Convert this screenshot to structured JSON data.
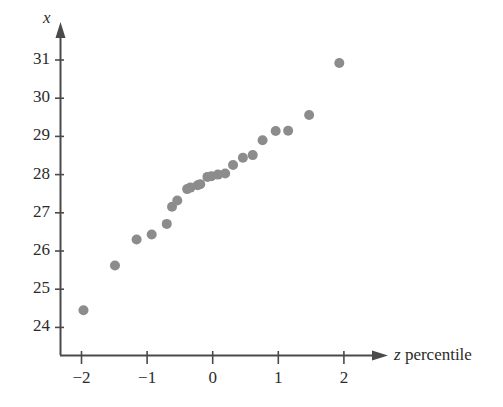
{
  "figure": {
    "background": "#ffffff",
    "axis_color": "#4a4a4a",
    "point_color": "#8c8c8c",
    "point_radius": 5
  },
  "axes": {
    "y_axis_title": "x",
    "x_axis_title_symbol": "z",
    "x_axis_title_text": " percentile",
    "y_ticks": [
      "24",
      "25",
      "26",
      "27",
      "28",
      "29",
      "30",
      "31"
    ],
    "x_ticks": [
      "−2",
      "−1",
      "0",
      "1",
      "2"
    ]
  },
  "chart_data": {
    "type": "scatter",
    "title": "",
    "xlabel": "z percentile",
    "ylabel": "x",
    "xlim": [
      -2.5,
      2.6
    ],
    "ylim": [
      23.4,
      31.6
    ],
    "grid": false,
    "legend": null,
    "x": [
      -1.97,
      -1.49,
      -1.16,
      -0.93,
      -0.7,
      -0.62,
      -0.54,
      -0.39,
      -0.34,
      -0.23,
      -0.19,
      -0.08,
      -0.02,
      0.08,
      0.19,
      0.31,
      0.46,
      0.61,
      0.76,
      0.96,
      1.15,
      1.47,
      1.93
    ],
    "y": [
      24.45,
      25.62,
      26.3,
      26.43,
      26.71,
      27.16,
      27.32,
      27.62,
      27.66,
      27.72,
      27.75,
      27.94,
      27.96,
      28.0,
      28.03,
      28.25,
      28.44,
      28.51,
      28.9,
      29.14,
      29.15,
      29.56,
      30.92
    ],
    "points": [
      {
        "z": -1.97,
        "x": 24.45
      },
      {
        "z": -1.49,
        "x": 25.62
      },
      {
        "z": -1.16,
        "x": 26.3
      },
      {
        "z": -0.93,
        "x": 26.43
      },
      {
        "z": -0.7,
        "x": 26.71
      },
      {
        "z": -0.62,
        "x": 27.16
      },
      {
        "z": -0.54,
        "x": 27.32
      },
      {
        "z": -0.39,
        "x": 27.62
      },
      {
        "z": -0.34,
        "x": 27.66
      },
      {
        "z": -0.23,
        "x": 27.72
      },
      {
        "z": -0.19,
        "x": 27.75
      },
      {
        "z": -0.08,
        "x": 27.94
      },
      {
        "z": -0.02,
        "x": 27.96
      },
      {
        "z": 0.08,
        "x": 28.0
      },
      {
        "z": 0.19,
        "x": 28.03
      },
      {
        "z": 0.31,
        "x": 28.25
      },
      {
        "z": 0.46,
        "x": 28.44
      },
      {
        "z": 0.61,
        "x": 28.51
      },
      {
        "z": 0.76,
        "x": 28.9
      },
      {
        "z": 0.96,
        "x": 29.14
      },
      {
        "z": 1.15,
        "x": 29.15
      },
      {
        "z": 1.47,
        "x": 29.56
      },
      {
        "z": 1.93,
        "x": 30.92
      }
    ]
  }
}
